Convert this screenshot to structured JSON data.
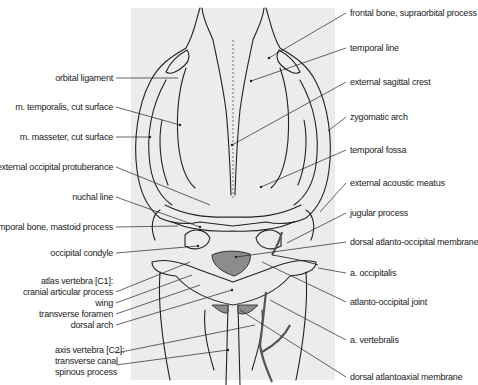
{
  "figure": {
    "colors": {
      "panel": "#ececec",
      "line": "#222222",
      "membrane": "#8c8c8c",
      "vessel": "#555555"
    }
  },
  "labels_left": [
    {
      "text": "orbital ligament",
      "x": 113,
      "y": 78
    },
    {
      "text": "m. temporalis, cut surface",
      "x": 113,
      "y": 107
    },
    {
      "text": "m. masseter, cut surface",
      "x": 113,
      "y": 137
    },
    {
      "text": "external occipital protuberance",
      "x": 113,
      "y": 167
    },
    {
      "text": "nuchal line",
      "x": 113,
      "y": 197
    },
    {
      "text": "temporal bone, mastoid process",
      "x": 113,
      "y": 227
    },
    {
      "text": "occipital condyle",
      "x": 113,
      "y": 253
    },
    {
      "text": "atlas vertebra [C1]:",
      "x": 113,
      "y": 281
    },
    {
      "text": "cranial articular process",
      "x": 113,
      "y": 292
    },
    {
      "text": "wing",
      "x": 113,
      "y": 303
    },
    {
      "text": "transverse foramen",
      "x": 113,
      "y": 314
    },
    {
      "text": "dorsal arch",
      "x": 113,
      "y": 325
    },
    {
      "text": "axis vertebra [C2]:",
      "x": 113,
      "y": 350
    },
    {
      "text": "transverse canal",
      "x": 113,
      "y": 361
    },
    {
      "text": "spinous process",
      "x": 113,
      "y": 372
    }
  ],
  "labels_right": [
    {
      "text": "frontal bone, supraorbital process",
      "x": 350,
      "y": 13
    },
    {
      "text": "temporal line",
      "x": 350,
      "y": 48
    },
    {
      "text": "external sagittal crest",
      "x": 350,
      "y": 82
    },
    {
      "text": "zygomatic arch",
      "x": 350,
      "y": 117
    },
    {
      "text": "temporal fossa",
      "x": 350,
      "y": 150
    },
    {
      "text": "external acoustic meatus",
      "x": 350,
      "y": 183
    },
    {
      "text": "jugular process",
      "x": 350,
      "y": 213
    },
    {
      "text": "dorsal atlanto-occipital membrane",
      "x": 350,
      "y": 242
    },
    {
      "text": "a. occipitalis",
      "x": 350,
      "y": 273
    },
    {
      "text": "atlanto-occipital joint",
      "x": 350,
      "y": 302
    },
    {
      "text": "a. vertebralis",
      "x": 350,
      "y": 340
    },
    {
      "text": "dorsal atlantoaxial membrane",
      "x": 350,
      "y": 377
    }
  ]
}
